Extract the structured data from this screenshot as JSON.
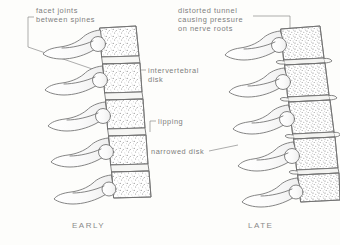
{
  "figure": {
    "background_color": "#fdfdfb",
    "ink_color": "#6b6b6b",
    "text_color": "#7d7d7d",
    "labels": {
      "facet_joints": "facet joints\nbetween spines",
      "distorted_tunnel": "distorted tunnel\ncausing pressure\non nerve roots",
      "intervertebral_disk": "intervertebral\ndisk",
      "lipping": "lipping",
      "narrowed_disk": "narrowed disk"
    },
    "captions": {
      "early": "EARLY",
      "late": "LATE"
    }
  },
  "diagram_data": {
    "type": "anatomical-line-drawing",
    "subject": "lumbar spine lateral view",
    "panels": [
      {
        "name": "early",
        "caption": "EARLY",
        "vertebra_count": 5,
        "disk_state": "normal height",
        "features": [
          "facet joints between spines",
          "intervertebral disk"
        ]
      },
      {
        "name": "late",
        "caption": "LATE",
        "vertebra_count": 5,
        "disk_state": "narrowed",
        "features": [
          "distorted tunnel causing pressure on nerve roots",
          "lipping",
          "narrowed disk"
        ]
      }
    ]
  }
}
